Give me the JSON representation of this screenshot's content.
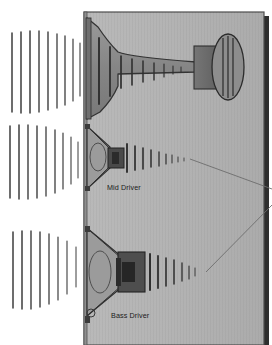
{
  "diagram": {
    "labels": {
      "mid_driver": "Mid Driver",
      "bass_driver": "Bass Driver"
    },
    "colors": {
      "background": "#ffffff",
      "cabinet_fill": "#b4b4b4",
      "cabinet_shadow": "#2c2c2c",
      "cabinet_outline": "#4a4a4a",
      "horn_fill": "#8a8a8a",
      "horn_outline": "#3a3a3a",
      "driver_dark": "#454545",
      "driver_mid": "#6e6e6e",
      "wave_line": "#3d3d3d",
      "label_text": "#1b1b1b",
      "pointer_line": "#6d6d6d"
    },
    "components": [
      {
        "name": "horn-assembly",
        "type": "compression-driver-horn",
        "label": ""
      },
      {
        "name": "compression-driver",
        "type": "oval-magnet",
        "label": ""
      },
      {
        "name": "mid-driver",
        "type": "cone-driver",
        "label": "Mid Driver"
      },
      {
        "name": "bass-driver",
        "type": "cone-driver",
        "label": "Bass Driver"
      }
    ],
    "cabinet": {
      "x": 84,
      "y": 12,
      "width": 180,
      "height": 333
    },
    "wavefronts": {
      "external": [
        {
          "name": "horn-output-waves",
          "cx": 84,
          "cy": 70,
          "count": 9,
          "note": "tall vertical arcs radiating left from horn mouth"
        },
        {
          "name": "mid-output-waves",
          "cx": 84,
          "cy": 160,
          "count": 9,
          "note": "vertical arcs radiating left from mid driver"
        },
        {
          "name": "bass-output-waves",
          "cx": 84,
          "cy": 268,
          "count": 8,
          "note": "vertical arcs radiating left from bass driver"
        }
      ],
      "internal": [
        {
          "name": "horn-throat-waves",
          "count": 8,
          "note": "shrinking arcs along horn throat"
        },
        {
          "name": "mid-rear-waves",
          "count": 8,
          "note": "shrinking arcs behind mid driver"
        },
        {
          "name": "bass-rear-waves",
          "count": 7,
          "note": "shrinking arcs behind bass driver"
        }
      ]
    },
    "pointers": [
      {
        "name": "mid-pointer-line",
        "from": [
          190,
          159
        ],
        "to": [
          272,
          188
        ]
      },
      {
        "name": "bass-pointer-line",
        "from": [
          207,
          272
        ],
        "to": [
          272,
          205
        ]
      }
    ]
  }
}
